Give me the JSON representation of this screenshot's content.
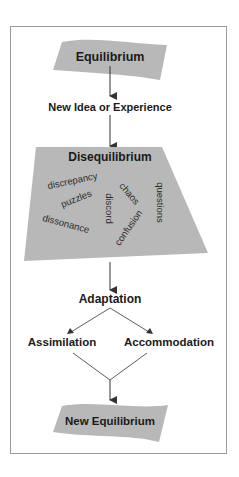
{
  "diagram": {
    "nodes": {
      "equilibrium": "Equilibrium",
      "new_idea": "New Idea or Experience",
      "disequilibrium": "Disequilibrium",
      "adaptation": "Adaptation",
      "assimilation": "Assimilation",
      "accommodation": "Accommodation",
      "new_equilibrium": "New Equilibrium"
    },
    "disequilibrium_words": {
      "discrepancy": "discrepancy",
      "puzzles": "puzzles",
      "dissonance": "dissonance",
      "discord": "discord",
      "chaos": "chaos",
      "confusion": "confusion",
      "questions": "questions"
    },
    "colors": {
      "shape_fill": "#b8b8b8",
      "frame_border": "#9a9a9a",
      "arrow": "#333333",
      "text": "#1a1a1a"
    }
  }
}
